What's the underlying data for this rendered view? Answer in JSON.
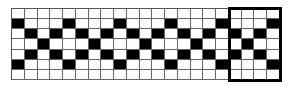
{
  "pattern": {
    "rows": 7,
    "cols": 21,
    "filled_color": "#000000",
    "empty_color": "#ffffff",
    "cells": [
      "000000000000000000000",
      "100010001000100010001",
      "010101010101010101010",
      "001000100010001000100",
      "010101010101010101010",
      "100010001000100010001",
      "000000000000000000000"
    ],
    "repeat_unit": {
      "start_col": 17,
      "end_col": 20,
      "start_row": 0,
      "end_row": 6,
      "border_color": "#000000"
    }
  }
}
